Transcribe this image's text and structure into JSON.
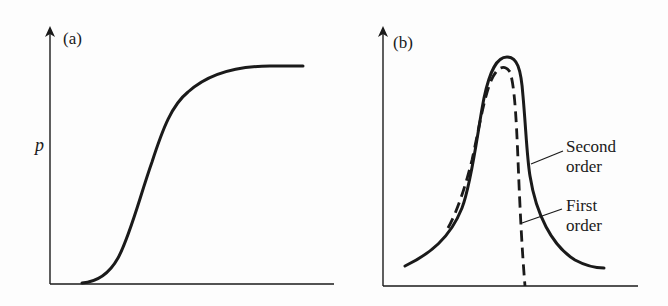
{
  "figure": {
    "panels": [
      {
        "id": "a",
        "label": "(a)",
        "y_axis_label": "p",
        "curve": "sigmoid (S-shaped) rising from near zero to a plateau"
      },
      {
        "id": "b",
        "label": "(b)",
        "curves": [
          {
            "name": "Second order",
            "style": "solid",
            "label_line1": "Second",
            "label_line2": "order"
          },
          {
            "name": "First order",
            "style": "dashed",
            "label_line1": "First",
            "label_line2": "order"
          }
        ]
      }
    ],
    "colors": {
      "ink": "#1a1a1a",
      "background": "#fdfdfd"
    }
  }
}
